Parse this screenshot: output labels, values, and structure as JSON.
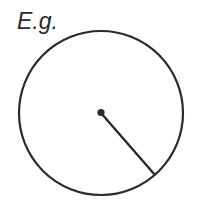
{
  "diagram": {
    "label": "E.g.",
    "shape": "circle",
    "stroke_color": "#2a2a2a",
    "circle": {
      "cx": 101,
      "cy": 113,
      "r": 82
    },
    "center_point": {
      "x": 101,
      "y": 113
    },
    "radius_line_end": {
      "x": 155,
      "y": 175
    }
  }
}
